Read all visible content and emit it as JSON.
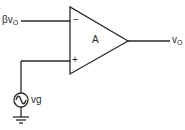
{
  "diagram": {
    "type": "op-amp circuit",
    "amplifier_gain_label": "A",
    "inverting_input_symbol": "−",
    "noninverting_input_symbol": "+",
    "feedback_input_label": {
      "main": "βv",
      "sub": "O"
    },
    "output_label": {
      "main": "v",
      "sub": "O"
    },
    "source_label": "vg",
    "colors": {
      "stroke": "#2a2a2a",
      "background": "#ffffff"
    }
  }
}
